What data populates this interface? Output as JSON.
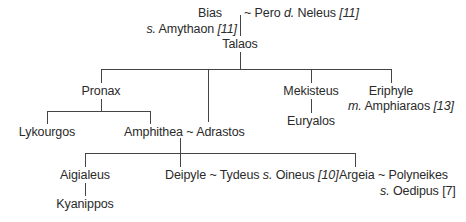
{
  "diagram": {
    "type": "family-tree",
    "nodes": {
      "bias": {
        "name": "Bias",
        "note_prefix": "s.",
        "note_name": "Amythaon",
        "ref": "[11]"
      },
      "pero": {
        "name": "Pero",
        "note_prefix": "d.",
        "note_name": "Neleus",
        "ref": "[11]"
      },
      "marriage_sign": "~",
      "talaos": {
        "name": "Talaos"
      },
      "pronax": {
        "name": "Pronax"
      },
      "adrastos": {
        "name": "Adrastos"
      },
      "mekisteus": {
        "name": "Mekisteus"
      },
      "eriphyle": {
        "name": "Eriphyle",
        "note_prefix": "m.",
        "note_name": "Amphiaraos",
        "ref": "[13]"
      },
      "lykourgos": {
        "name": "Lykourgos"
      },
      "amphithea": {
        "name": "Amphithea"
      },
      "euryalos": {
        "name": "Euryalos"
      },
      "aigialeus": {
        "name": "Aigialeus"
      },
      "deipyle": {
        "name": "Deipyle"
      },
      "tydeus": {
        "name": "Tydeus",
        "note_prefix": "s.",
        "note_name": "Oineus",
        "ref": "[10]"
      },
      "argeia": {
        "name": "Argeia"
      },
      "polyneikes": {
        "name": "Polyneikes",
        "note_prefix": "s.",
        "note_name": "Oedipus",
        "ref": "[7]"
      },
      "kyanippos": {
        "name": "Kyanippos"
      }
    },
    "edges": [
      [
        "bias~pero",
        "talaos"
      ],
      [
        "talaos",
        "pronax"
      ],
      [
        "talaos",
        "adrastos"
      ],
      [
        "talaos",
        "mekisteus"
      ],
      [
        "talaos",
        "eriphyle"
      ],
      [
        "pronax",
        "lykourgos"
      ],
      [
        "pronax",
        "amphithea"
      ],
      [
        "mekisteus",
        "euryalos"
      ],
      [
        "amphithea~adrastos",
        "aigialeus"
      ],
      [
        "amphithea~adrastos",
        "deipyle"
      ],
      [
        "amphithea~adrastos",
        "argeia"
      ],
      [
        "aigialeus",
        "kyanippos"
      ]
    ]
  }
}
